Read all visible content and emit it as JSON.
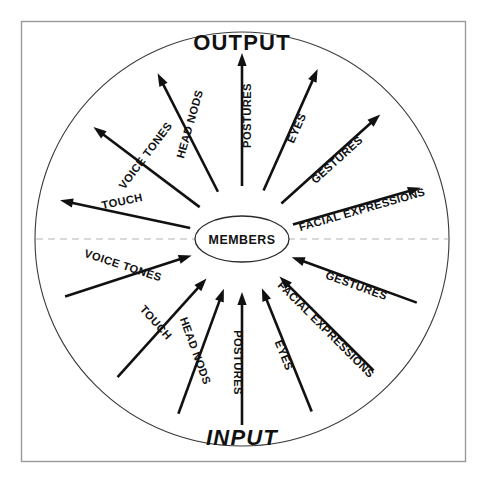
{
  "figure": {
    "hub_label": "MEMBERS",
    "output_label": "OUTPUT",
    "input_label": "INPUT",
    "colors": {
      "frame_stroke": "#9a9a9a",
      "circle_stroke": "#3b3b3b",
      "divider_stroke": "#b4b4b4",
      "arrow_stroke": "#111111",
      "text": "#111111",
      "background": "#ffffff"
    }
  },
  "chart_data": {
    "type": "diagram",
    "subtype": "radial-spoke",
    "center_node": "MEMBERS",
    "halves": [
      {
        "name": "OUTPUT",
        "direction": "outward-from-center",
        "position": "top"
      },
      {
        "name": "INPUT",
        "direction": "inward-to-center",
        "position": "bottom"
      }
    ],
    "channels": [
      "TOUCH",
      "VOICE TONES",
      "HEAD NODS",
      "POSTURES",
      "EYES",
      "GESTURES",
      "FACIAL EXPRESSIONS"
    ],
    "output_rays": [
      {
        "label": "TOUCH",
        "angle_deg": 168,
        "label_angle_deg": -12
      },
      {
        "label": "VOICE TONES",
        "angle_deg": 143,
        "label_angle_deg": -53
      },
      {
        "label": "HEAD NODS",
        "angle_deg": 117,
        "label_angle_deg": -74
      },
      {
        "label": "POSTURES",
        "angle_deg": 90,
        "label_angle_deg": -90
      },
      {
        "label": "EYES",
        "angle_deg": 66,
        "label_angle_deg": -66
      },
      {
        "label": "GESTURES",
        "angle_deg": 42,
        "label_angle_deg": -42
      },
      {
        "label": "FACIAL EXPRESSIONS",
        "angle_deg": 16,
        "label_angle_deg": -16
      }
    ],
    "input_rays": [
      {
        "label": "VOICE TONES",
        "angle_deg": 198,
        "label_angle_deg": 18
      },
      {
        "label": "TOUCH",
        "angle_deg": 228,
        "label_angle_deg": 48
      },
      {
        "label": "HEAD NODS",
        "angle_deg": 250,
        "label_angle_deg": 70
      },
      {
        "label": "POSTURES",
        "angle_deg": 270,
        "label_angle_deg": 90
      },
      {
        "label": "EYES",
        "angle_deg": 292,
        "label_angle_deg": 68
      },
      {
        "label": "FACIAL EXPRESSIONS",
        "angle_deg": 315,
        "label_angle_deg": 45
      },
      {
        "label": "GESTURES",
        "angle_deg": 340,
        "label_angle_deg": 20
      }
    ],
    "geometry": {
      "center_x": 242,
      "center_y": 239,
      "outer_radius": 207,
      "hub_rx": 47,
      "hub_ry": 23,
      "ray_inner_radius": 53,
      "ray_outer_radius": 186
    },
    "legend": null,
    "grid": false
  }
}
